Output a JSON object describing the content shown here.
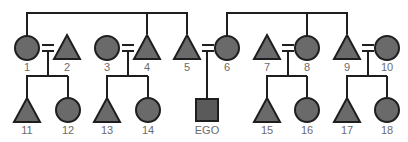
{
  "diagram": {
    "type": "kinship-chart",
    "colors": {
      "fill": "#6a6a6a",
      "stroke": "#1e1e1e",
      "label": "#6b6b6b",
      "background": "#ffffff"
    },
    "legend": {
      "circle": "female",
      "triangle": "male",
      "square": "ego",
      "double_line": "marriage"
    },
    "generation_1": [
      {
        "id": "1",
        "label": "1",
        "shape": "circle"
      },
      {
        "id": "2",
        "label": "2",
        "shape": "triangle"
      },
      {
        "id": "3",
        "label": "3",
        "shape": "circle"
      },
      {
        "id": "4",
        "label": "4",
        "shape": "triangle"
      },
      {
        "id": "5",
        "label": "5",
        "shape": "triangle"
      },
      {
        "id": "6",
        "label": "6",
        "shape": "circle"
      },
      {
        "id": "7",
        "label": "7",
        "shape": "triangle"
      },
      {
        "id": "8",
        "label": "8",
        "shape": "circle"
      },
      {
        "id": "9",
        "label": "9",
        "shape": "triangle"
      },
      {
        "id": "10",
        "label": "10",
        "shape": "circle"
      }
    ],
    "generation_2": [
      {
        "id": "11",
        "label": "11",
        "shape": "triangle"
      },
      {
        "id": "12",
        "label": "12",
        "shape": "circle"
      },
      {
        "id": "13",
        "label": "13",
        "shape": "triangle"
      },
      {
        "id": "14",
        "label": "14",
        "shape": "circle"
      },
      {
        "id": "ego",
        "label": "EGO",
        "shape": "square"
      },
      {
        "id": "15",
        "label": "15",
        "shape": "triangle"
      },
      {
        "id": "16",
        "label": "16",
        "shape": "circle"
      },
      {
        "id": "17",
        "label": "17",
        "shape": "triangle"
      },
      {
        "id": "18",
        "label": "18",
        "shape": "circle"
      }
    ],
    "sibling_groups": [
      {
        "members": [
          "1",
          "4",
          "5"
        ]
      },
      {
        "members": [
          "6",
          "8",
          "9"
        ]
      }
    ],
    "marriages": [
      {
        "spouses": [
          "1",
          "2"
        ],
        "children": [
          "11",
          "12"
        ]
      },
      {
        "spouses": [
          "3",
          "4"
        ],
        "children": [
          "13",
          "14"
        ]
      },
      {
        "spouses": [
          "5",
          "6"
        ],
        "children": [
          "ego"
        ]
      },
      {
        "spouses": [
          "7",
          "8"
        ],
        "children": [
          "15",
          "16"
        ]
      },
      {
        "spouses": [
          "9",
          "10"
        ],
        "children": [
          "17",
          "18"
        ]
      }
    ]
  }
}
